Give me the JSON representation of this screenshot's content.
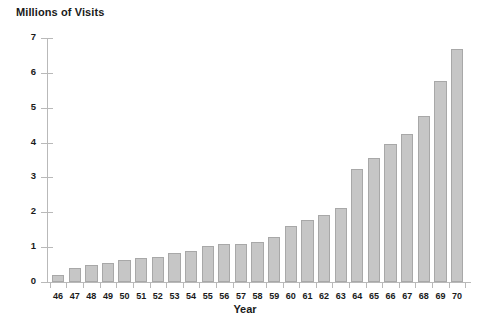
{
  "chart_data": {
    "type": "bar",
    "title": "",
    "ylabel": "Millions of Visits",
    "xlabel": "Year",
    "ylim": [
      0,
      7
    ],
    "yticks": [
      0,
      1,
      2,
      3,
      4,
      5,
      6,
      7
    ],
    "ytick_labels": [
      "0",
      "1",
      "2",
      "3",
      "4",
      "5",
      "6",
      "7"
    ],
    "grid": false,
    "legend": null,
    "categories": [
      "46",
      "47",
      "48",
      "49",
      "50",
      "51",
      "52",
      "53",
      "54",
      "55",
      "56",
      "57",
      "58",
      "59",
      "60",
      "61",
      "62",
      "63",
      "64",
      "65",
      "66",
      "67",
      "68",
      "69",
      "70"
    ],
    "values": [
      0.2,
      0.4,
      0.5,
      0.55,
      0.62,
      0.7,
      0.73,
      0.82,
      0.9,
      1.02,
      1.1,
      1.08,
      1.15,
      1.3,
      1.62,
      1.78,
      1.92,
      2.12,
      3.25,
      3.57,
      3.95,
      4.25,
      4.75,
      5.78,
      6.68
    ],
    "bar_color": "#c6c6c6",
    "bar_edge_color": "#a8a8a8",
    "axis_color": "#b9b9b9",
    "text_color": "#1a1a1a"
  }
}
